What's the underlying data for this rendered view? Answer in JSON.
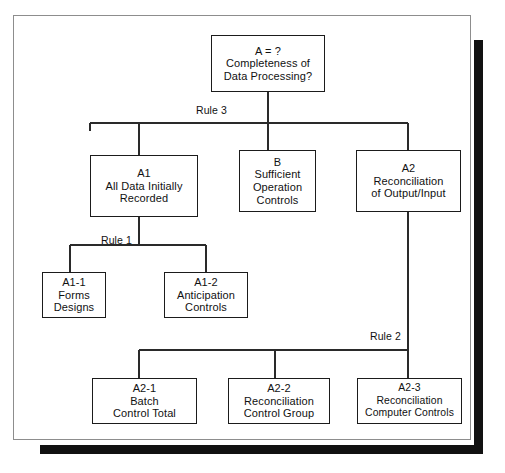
{
  "diagram": {
    "type": "hierarchical-decomposition-tree",
    "title_box": {
      "id": "A",
      "lines": [
        "A = ?",
        "Completeness of",
        "Data Processing?"
      ]
    },
    "nodes": [
      {
        "key": "root",
        "name": "completeness-of-data-processing",
        "lines": [
          "A = ?",
          "Completeness of",
          "Data Processing?"
        ],
        "x": 211,
        "y": 35,
        "w": 114,
        "h": 57
      },
      {
        "key": "a1",
        "name": "all-data-initially-recorded",
        "lines": [
          "A1",
          "All Data Initially",
          "Recorded"
        ],
        "x": 90,
        "y": 155,
        "w": 108,
        "h": 62
      },
      {
        "key": "b",
        "name": "sufficient-operation-controls",
        "lines": [
          "B",
          "Sufficient",
          "Operation",
          "Controls"
        ],
        "x": 239,
        "y": 150,
        "w": 77,
        "h": 62
      },
      {
        "key": "a2",
        "name": "reconciliation-of-output-input",
        "lines": [
          "A2",
          "Reconciliation",
          "of Output/Input"
        ],
        "x": 356,
        "y": 150,
        "w": 105,
        "h": 62
      },
      {
        "key": "a1_1",
        "name": "forms-designs",
        "lines": [
          "A1-1",
          "Forms",
          "Designs"
        ],
        "x": 42,
        "y": 272,
        "w": 64,
        "h": 46
      },
      {
        "key": "a1_2",
        "name": "anticipation-controls",
        "lines": [
          "A1-2",
          "Anticipation",
          "Controls"
        ],
        "x": 164,
        "y": 272,
        "w": 84,
        "h": 46
      },
      {
        "key": "a2_1",
        "name": "batch-control-total",
        "lines": [
          "A2-1",
          "Batch",
          "Control Total"
        ],
        "x": 92,
        "y": 378,
        "w": 105,
        "h": 46
      },
      {
        "key": "a2_2",
        "name": "reconciliation-control-group",
        "lines": [
          "A2-2",
          "Reconciliation",
          "Control Group"
        ],
        "x": 228,
        "y": 378,
        "w": 102,
        "h": 46
      },
      {
        "key": "a2_3",
        "name": "reconciliation-computer-controls",
        "lines": [
          "A2-3",
          "Reconciliation",
          "Computer Controls"
        ],
        "x": 357,
        "y": 378,
        "w": 105,
        "h": 46
      }
    ],
    "rules": [
      {
        "key": "rule3",
        "label": "Rule 3",
        "x": 196,
        "y": 104
      },
      {
        "key": "rule1",
        "label": "Rule 1",
        "x": 101,
        "y": 234
      },
      {
        "key": "rule2",
        "label": "Rule 2",
        "x": 370,
        "y": 330
      }
    ],
    "colors": {
      "box_border": "#1b1b1b",
      "frame_border": "#8d8d8d",
      "connector": "#2a2a2a",
      "shadow": "#111111",
      "background": "#ffffff",
      "text": "#111111"
    }
  }
}
